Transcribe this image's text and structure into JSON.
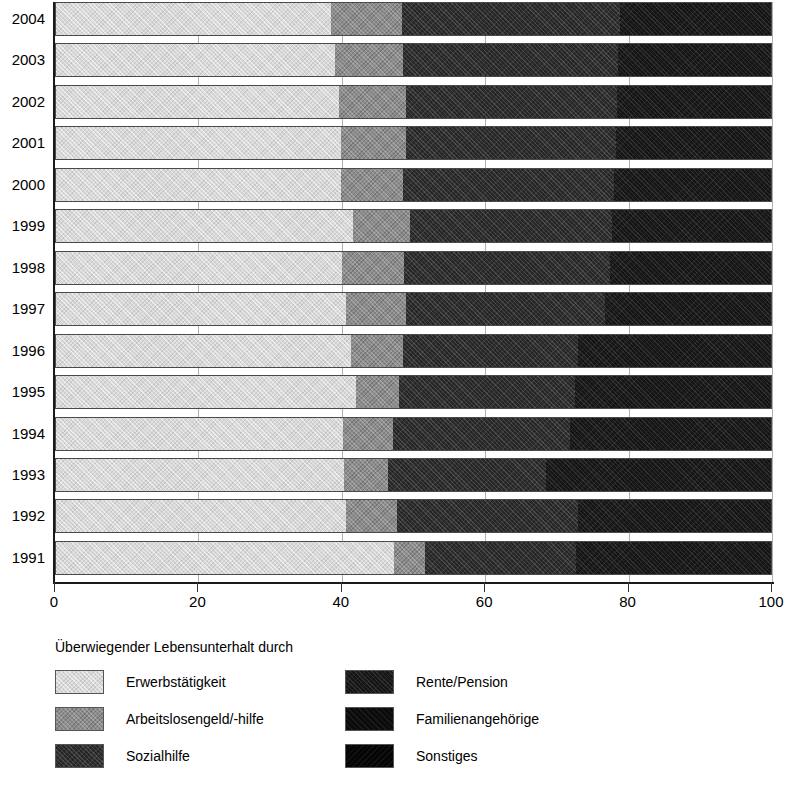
{
  "chart_data": {
    "type": "bar",
    "orientation": "horizontal",
    "stacked": true,
    "stacked_percent": true,
    "title": "",
    "subtitle": "",
    "xlabel": "",
    "ylabel": "",
    "xlim": [
      0,
      100
    ],
    "xticks": [
      0,
      20,
      40,
      60,
      80,
      100
    ],
    "xtick_labels": [
      "0",
      "20",
      "40",
      "60",
      "80",
      "100"
    ],
    "grid": true,
    "legend_position": "below",
    "legend_title": "Überwiegender Lebensunterhalt durch",
    "categories": [
      "1991",
      "1992",
      "1993",
      "1994",
      "1995",
      "1996",
      "1997",
      "1998",
      "1999",
      "2000",
      "2001",
      "2002",
      "2003",
      "2004"
    ],
    "category_order_display": [
      "2004",
      "2003",
      "2002",
      "2001",
      "2000",
      "1999",
      "1998",
      "1997",
      "1996",
      "1995",
      "1994",
      "1993",
      "1992",
      "1991"
    ],
    "series": [
      {
        "name": "Erwerbstätigkeit",
        "color": "#d8d8d8",
        "values": [
          47.3,
          40.5,
          40.3,
          40.6,
          42.0,
          41.3,
          40.6,
          40.0,
          41.6,
          39.9,
          39.9,
          39.6,
          39.0,
          38.4
        ]
      },
      {
        "name": "Arbeitslosengeld/-hilfe",
        "color": "#8c8c8c",
        "values": [
          4.3,
          7.2,
          6.2,
          7.0,
          6.0,
          7.3,
          8.4,
          8.7,
          7.9,
          8.7,
          9.0,
          9.3,
          9.6,
          10.0
        ]
      },
      {
        "name": "Sozialhilfe",
        "color": "#262626",
        "values": [
          21.1,
          25.3,
          22.1,
          25.0,
          24.6,
          24.4,
          27.8,
          28.8,
          28.2,
          29.4,
          29.4,
          29.5,
          30.0,
          30.5
        ]
      },
      {
        "name": "Rente/Pension",
        "color": "#151515",
        "values": [
          27.3,
          27.0,
          31.4,
          28.4,
          27.4,
          27.0,
          23.2,
          22.5,
          22.3,
          22.0,
          21.7,
          21.6,
          21.4,
          21.1
        ]
      },
      {
        "name": "Familienangehörige",
        "color": "#0b0b0b",
        "values": [
          0.0,
          0.0,
          0.0,
          0.0,
          0.0,
          0.0,
          0.0,
          0.0,
          0.0,
          0.0,
          0.0,
          0.0,
          0.0,
          0.0
        ]
      },
      {
        "name": "Sonstiges",
        "color": "#050505",
        "values": [
          0.0,
          0.0,
          0.0,
          0.0,
          0.0,
          0.0,
          0.0,
          0.0,
          0.0,
          0.0,
          0.0,
          0.0,
          0.0,
          0.0
        ]
      }
    ]
  },
  "axis": {
    "x_tick_labels": [
      "0",
      "20",
      "40",
      "60",
      "80",
      "100"
    ],
    "y_tick_labels": [
      "2004",
      "2003",
      "2002",
      "2001",
      "2000",
      "1999",
      "1998",
      "1997",
      "1996",
      "1995",
      "1994",
      "1993",
      "1992",
      "1991"
    ]
  },
  "legend": {
    "title": "Überwiegender Lebensunterhalt durch",
    "items": [
      {
        "label": "Erwerbstätigkeit",
        "swatch": "swatch-erwerbstaetigkeit",
        "color": "#d8d8d8"
      },
      {
        "label": "Arbeitslosengeld/-hilfe",
        "swatch": "swatch-arbeitslosengeld",
        "color": "#8c8c8c"
      },
      {
        "label": "Sozialhilfe",
        "swatch": "swatch-sozialhilfe",
        "color": "#262626"
      },
      {
        "label": "Rente/Pension",
        "swatch": "swatch-rente-pension",
        "color": "#151515"
      },
      {
        "label": "Familienangehörige",
        "swatch": "swatch-familienangehoerige",
        "color": "#0b0b0b"
      },
      {
        "label": "Sonstiges",
        "swatch": "swatch-sonstiges",
        "color": "#050505"
      }
    ]
  }
}
